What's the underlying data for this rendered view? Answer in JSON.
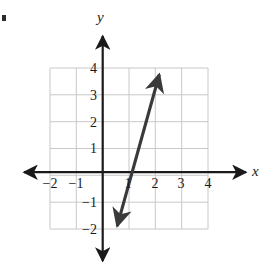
{
  "figure": {
    "bullet_mark": "•",
    "background_color": "#ffffff",
    "grid_color": "#c8c8c8",
    "axis_color": "#1a1a1a",
    "line_color": "#3a3a3a"
  },
  "axes": {
    "x_label": "x",
    "y_label": "y"
  },
  "chart_data": {
    "type": "line",
    "title": "",
    "xlabel": "x",
    "ylabel": "y",
    "xlim": [
      -2,
      4
    ],
    "ylim": [
      -2,
      4
    ],
    "grid": true,
    "legend": "none",
    "x_ticks": [
      -2,
      -1,
      1,
      2,
      3,
      4
    ],
    "y_ticks": [
      -2,
      -1,
      1,
      2,
      3,
      4
    ],
    "x_tick_labels": [
      "−2",
      "−1",
      "1",
      "2",
      "3",
      "4"
    ],
    "y_tick_labels": [
      "−2",
      "−1",
      "1",
      "2",
      "3",
      "4"
    ],
    "series": [
      {
        "name": "line",
        "x_intercept": 1,
        "slope": 3.3,
        "arrow_start": [
          0.57,
          -2.0
        ],
        "arrow_end": [
          2.15,
          3.7
        ],
        "double_arrow": true,
        "points": [
          [
            0.57,
            -2.0
          ],
          [
            1,
            0
          ],
          [
            2,
            3.3
          ],
          [
            2.15,
            3.7
          ]
        ]
      }
    ]
  }
}
